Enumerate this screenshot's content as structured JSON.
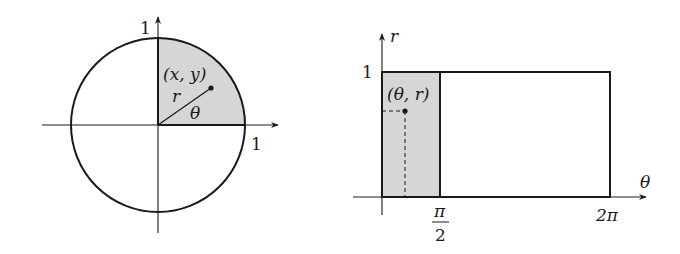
{
  "left_panel": {
    "title": "unit circle (Cartesian plane)",
    "x_axis_tick_label": "1",
    "y_axis_tick_label": "1",
    "point_label": "(x, y)",
    "radius_label": "r",
    "angle_label": "θ",
    "shaded_region": "first quadrant of unit disk"
  },
  "right_panel": {
    "title": "polar rectangle (θ, r) plane",
    "vertical_axis_label": "r",
    "horizontal_axis_label": "θ",
    "r_tick_label": "1",
    "theta_tick_half_pi_num": "π",
    "theta_tick_half_pi_den": "2",
    "theta_tick_two_pi": "2π",
    "point_label": "(θ, r)",
    "shaded_region": "0 ≤ θ ≤ π/2, 0 ≤ r ≤ 1"
  },
  "colors": {
    "ink": "#1a1a1a",
    "shade": "#d6d6d6",
    "background": "#ffffff"
  }
}
